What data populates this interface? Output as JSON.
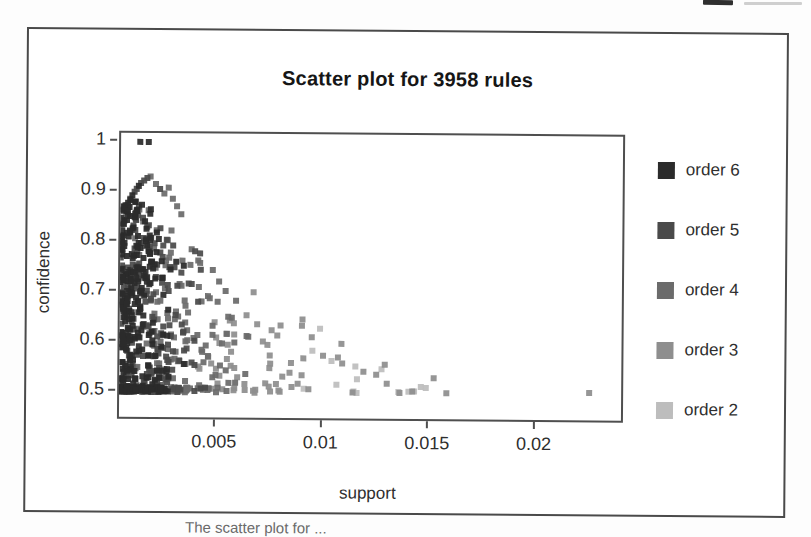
{
  "caption": {
    "text": "The scatter plot for ..."
  },
  "chart_data": {
    "type": "scatter",
    "title": "Scatter plot for 3958 rules",
    "xlabel": "support",
    "ylabel": "confidence",
    "n_rules": 3958,
    "x_ticks": [
      0.005,
      0.01,
      0.015,
      0.02
    ],
    "y_ticks": [
      1,
      0.9,
      0.8,
      0.7,
      0.6,
      0.5
    ],
    "xlim": [
      0.00045,
      0.024
    ],
    "ylim": [
      0.45,
      1.018
    ],
    "grid": false,
    "legend_position": "right",
    "legend": [
      {
        "order": 6,
        "label": "order 6",
        "color": "#2b2b2b"
      },
      {
        "order": 5,
        "label": "order 5",
        "color": "#4a4a4a"
      },
      {
        "order": 4,
        "label": "order 4",
        "color": "#6b6b6b"
      },
      {
        "order": 3,
        "label": "order 3",
        "color": "#8e8e8e"
      },
      {
        "order": 2,
        "label": "order 2",
        "color": "#bdbdbd"
      }
    ],
    "point_shape": "square",
    "point_size_px": 6,
    "notable_points": [
      [
        0.00135,
        1.0,
        6
      ],
      [
        0.00175,
        1.0,
        6
      ],
      [
        0.0008,
        0.878,
        6
      ],
      [
        0.0009,
        0.886,
        5
      ],
      [
        0.001,
        0.893,
        6
      ],
      [
        0.0011,
        0.9,
        5
      ],
      [
        0.0012,
        0.906,
        5
      ],
      [
        0.0013,
        0.912,
        6
      ],
      [
        0.0014,
        0.918,
        5
      ],
      [
        0.00155,
        0.923,
        5
      ],
      [
        0.0017,
        0.928,
        5
      ],
      [
        0.00185,
        0.931,
        4
      ],
      [
        0.0021,
        0.916,
        4
      ],
      [
        0.0023,
        0.906,
        5
      ],
      [
        0.0025,
        0.897,
        4
      ],
      [
        0.0027,
        0.909,
        4
      ],
      [
        0.0029,
        0.887,
        4
      ],
      [
        0.0031,
        0.872,
        4
      ],
      [
        0.0033,
        0.856,
        4
      ],
      [
        0.0042,
        0.778,
        5
      ],
      [
        0.0048,
        0.745,
        4
      ],
      [
        0.0051,
        0.722,
        4
      ],
      [
        0.0059,
        0.684,
        4
      ],
      [
        0.0064,
        0.655,
        3
      ],
      [
        0.0069,
        0.637,
        3
      ],
      [
        0.0075,
        0.575,
        3
      ],
      [
        0.0078,
        0.518,
        3
      ],
      [
        0.008,
        0.635,
        3
      ],
      [
        0.0085,
        0.56,
        3
      ],
      [
        0.009,
        0.635,
        3
      ],
      [
        0.0095,
        0.585,
        2
      ],
      [
        0.01,
        0.575,
        3
      ],
      [
        0.0104,
        0.565,
        2
      ],
      [
        0.0107,
        0.572,
        3
      ],
      [
        0.0109,
        0.56,
        3
      ],
      [
        0.0114,
        0.502,
        3
      ],
      [
        0.0119,
        0.544,
        3
      ],
      [
        0.0125,
        0.538,
        3
      ],
      [
        0.0129,
        0.558,
        3
      ],
      [
        0.013,
        0.52,
        3
      ],
      [
        0.0136,
        0.502,
        3
      ],
      [
        0.0142,
        0.505,
        3
      ],
      [
        0.0152,
        0.532,
        3
      ],
      [
        0.0158,
        0.502,
        3
      ],
      [
        0.0225,
        0.505,
        3
      ]
    ],
    "density_model": {
      "comment": "dense overplotted wedge: ~3958 rules, support mostly < 0.004, confidence 0.5-0.93, upper envelope decays with support; darker (higher order) at lower support",
      "envelope": {
        "base": 0.5,
        "amp": 0.43,
        "x0": 0.0005,
        "scale": 0.0085,
        "cap": 0.93
      },
      "clusters": [
        {
          "n": 560,
          "x_min": 0.00045,
          "x_mean": 0.0011,
          "x_max": 0.006,
          "y_pow": 1.15,
          "y_cap": 0.885,
          "floor": 0.22
        },
        {
          "n": 150,
          "x_min": 0.0018,
          "x_mean": 0.002,
          "x_max": 0.0095,
          "y_pow": 1.3,
          "y_cap": 0.8,
          "floor": 0.25
        },
        {
          "n": 45,
          "x_min": 0.005,
          "x_mean": 0.0035,
          "x_max": 0.016,
          "y_pow": 1.6,
          "y_cap": 0.65,
          "floor": 0.3
        }
      ],
      "order_assignment": {
        "thresholds": [
          0.1,
          0.22,
          0.42,
          0.75
        ],
        "orders": [
          6,
          5,
          4,
          3,
          2
        ],
        "x_norm_span": 0.012,
        "jitter": 0.35
      }
    }
  }
}
